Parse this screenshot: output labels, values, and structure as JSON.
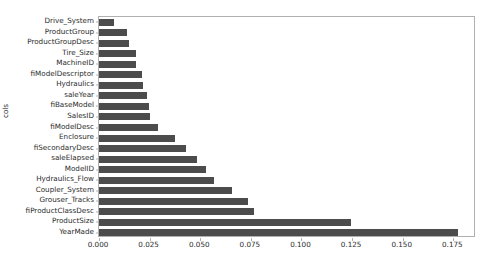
{
  "chart_data": {
    "type": "bar",
    "orientation": "horizontal",
    "title": "",
    "xlabel": "",
    "ylabel": "cols",
    "xlim": [
      0.0,
      0.1862
    ],
    "grid": false,
    "legend": null,
    "bar_color": "#4c4c4c",
    "xticks": [
      0.0,
      0.025,
      0.05,
      0.075,
      0.1,
      0.125,
      0.15,
      0.175
    ],
    "xtick_labels": [
      "0.000",
      "0.025",
      "0.050",
      "0.075",
      "0.100",
      "0.125",
      "0.150",
      "0.175"
    ],
    "categories": [
      "Drive_System",
      "ProductGroup",
      "ProductGroupDesc",
      "Tire_Size",
      "MachineID",
      "fiModelDescriptor",
      "Hydraulics",
      "saleYear",
      "fiBaseModel",
      "SalesID",
      "fiModelDesc",
      "Enclosure",
      "fiSecondaryDesc",
      "saleElapsed",
      "ModelID",
      "Hydraulics_Flow",
      "Coupler_System",
      "Grouser_Tracks",
      "fiProductClassDesc",
      "ProductSize",
      "YearMade"
    ],
    "values": [
      0.0074,
      0.0138,
      0.0148,
      0.0182,
      0.0184,
      0.0212,
      0.0218,
      0.0238,
      0.0247,
      0.0252,
      0.0291,
      0.0375,
      0.0429,
      0.0484,
      0.0528,
      0.0567,
      0.0656,
      0.0735,
      0.0765,
      0.1247,
      0.1775
    ]
  }
}
